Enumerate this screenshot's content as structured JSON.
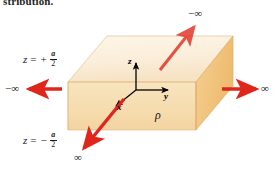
{
  "figure": {
    "caption_fragment": "stribution.",
    "background_color": "#ffffff"
  },
  "slab": {
    "name": "charge-slab",
    "top_face_color": "#fbeedb",
    "front_face_color": "#f7dfb4",
    "right_face_color": "#f2c37e",
    "edge_color": "#d9a066",
    "charge_density_label": "ρ"
  },
  "axes": {
    "origin_label": "",
    "z_label": "z",
    "y_label": "y",
    "x_label": "x",
    "color": "#000000"
  },
  "boundaries": {
    "top_plane_label": {
      "var": "z",
      "op": "=",
      "sign": "+",
      "numerator": "a",
      "denominator": "2"
    },
    "bottom_plane_label": {
      "var": "z",
      "op": "=",
      "sign": "−",
      "numerator": "a",
      "denominator": "2"
    }
  },
  "extent_arrows": {
    "color": "#e0251b",
    "items": [
      {
        "name": "extent-arrow-left",
        "label": "−∞",
        "direction": "left"
      },
      {
        "name": "extent-arrow-right",
        "label": "∞",
        "direction": "right"
      },
      {
        "name": "extent-arrow-back-right",
        "label": "−∞",
        "direction": "up-right"
      },
      {
        "name": "extent-arrow-front-left",
        "label": "∞",
        "direction": "down-left"
      }
    ]
  }
}
